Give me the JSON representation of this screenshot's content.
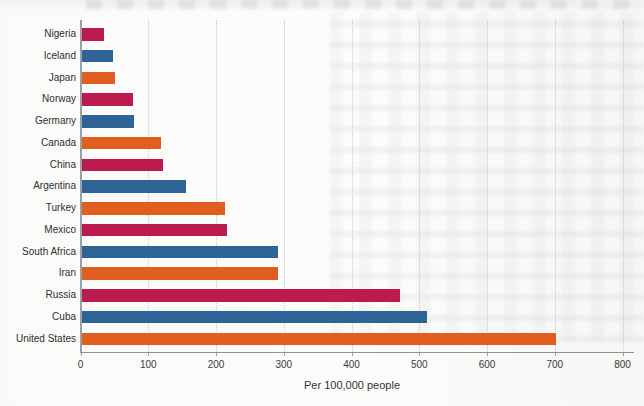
{
  "chart_data": {
    "type": "bar",
    "orientation": "horizontal",
    "title": "",
    "xlabel": "Per 100,000 people",
    "ylabel": "",
    "categories": [
      "Nigeria",
      "Iceland",
      "Japan",
      "Norway",
      "Germany",
      "Canada",
      "China",
      "Argentina",
      "Turkey",
      "Mexico",
      "South Africa",
      "Iran",
      "Russia",
      "Cuba",
      "United States"
    ],
    "values": [
      33,
      47,
      50,
      77,
      78,
      118,
      120,
      155,
      212,
      215,
      290,
      291,
      470,
      510,
      700
    ],
    "xlim": [
      0,
      800
    ],
    "xticks": [
      0,
      100,
      200,
      300,
      400,
      500,
      600,
      700,
      800
    ],
    "grid": "vertical-dotted",
    "legend": "none",
    "bar_color_cycle_top_to_bottom": [
      "crimson",
      "blue",
      "orange"
    ],
    "colors": {
      "crimson": "#BB1B4D",
      "blue": "#2E6495",
      "orange": "#E05E1E"
    },
    "axis_line_color": "#8f9295",
    "gridline_color": "#c6c9cc"
  }
}
